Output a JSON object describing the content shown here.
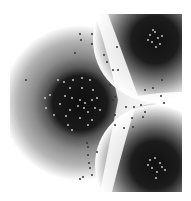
{
  "figure": {
    "background": "#ffffff",
    "frame": {
      "x": 10,
      "y": 14,
      "w": 172,
      "h": 178
    },
    "clusters": [
      {
        "name": "left-cluster",
        "cx": 80,
        "cy": 103,
        "core_r": 30,
        "halo_r": 78,
        "clip": "left"
      },
      {
        "name": "top-right-cluster",
        "cx": 155,
        "cy": 40,
        "core_r": 22,
        "halo_r": 62,
        "clip": "topright"
      },
      {
        "name": "bottom-right-cluster",
        "cx": 155,
        "cy": 165,
        "core_r": 24,
        "halo_r": 60,
        "clip": "bottomright"
      }
    ],
    "points": {
      "dark": [
        [
          80,
          34
        ],
        [
          92,
          34
        ],
        [
          81,
          40
        ],
        [
          92,
          44
        ],
        [
          75,
          53
        ],
        [
          104,
          55
        ],
        [
          107,
          62
        ],
        [
          117,
          47
        ],
        [
          113,
          70
        ],
        [
          118,
          70
        ],
        [
          26,
          80
        ],
        [
          162,
          80
        ],
        [
          153,
          88
        ],
        [
          145,
          90
        ],
        [
          161,
          96
        ],
        [
          164,
          103
        ],
        [
          126,
          107
        ],
        [
          134,
          107
        ],
        [
          141,
          105
        ],
        [
          145,
          112
        ],
        [
          132,
          118
        ],
        [
          143,
          117
        ],
        [
          115,
          115
        ],
        [
          115,
          125
        ],
        [
          124,
          128
        ],
        [
          133,
          127
        ],
        [
          87,
          143
        ],
        [
          88,
          147
        ],
        [
          97,
          152
        ],
        [
          88,
          155
        ],
        [
          89,
          163
        ],
        [
          90,
          168
        ],
        [
          92,
          175
        ],
        [
          83,
          177
        ],
        [
          80,
          179
        ],
        [
          115,
          97
        ],
        [
          110,
          85
        ],
        [
          113,
          100
        ]
      ],
      "light": [
        [
          58,
          80
        ],
        [
          64,
          82
        ],
        [
          73,
          80
        ],
        [
          82,
          78
        ],
        [
          90,
          80
        ],
        [
          70,
          88
        ],
        [
          82,
          88
        ],
        [
          93,
          90
        ],
        [
          65,
          96
        ],
        [
          72,
          98
        ],
        [
          80,
          100
        ],
        [
          85,
          103
        ],
        [
          92,
          100
        ],
        [
          97,
          98
        ],
        [
          78,
          106
        ],
        [
          84,
          108
        ],
        [
          70,
          110
        ],
        [
          88,
          112
        ],
        [
          95,
          108
        ],
        [
          60,
          104
        ],
        [
          50,
          95
        ],
        [
          45,
          98
        ],
        [
          46,
          108
        ],
        [
          54,
          115
        ],
        [
          66,
          116
        ],
        [
          80,
          118
        ],
        [
          92,
          120
        ],
        [
          68,
          125
        ],
        [
          72,
          130
        ],
        [
          88,
          125
        ],
        [
          100,
          110
        ],
        [
          150,
          35
        ],
        [
          155,
          32
        ],
        [
          158,
          38
        ],
        [
          152,
          42
        ],
        [
          160,
          44
        ],
        [
          148,
          40
        ],
        [
          156,
          47
        ],
        [
          162,
          36
        ],
        [
          153,
          30
        ],
        [
          150,
          160
        ],
        [
          155,
          158
        ],
        [
          160,
          163
        ],
        [
          152,
          168
        ],
        [
          157,
          172
        ],
        [
          162,
          167
        ],
        [
          165,
          170
        ],
        [
          148,
          165
        ],
        [
          156,
          178
        ]
      ]
    }
  }
}
